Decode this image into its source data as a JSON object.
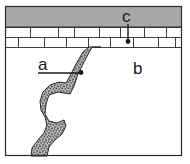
{
  "figure": {
    "type": "geologic-cross-section",
    "frame": {
      "x": 5,
      "y": 6,
      "width": 177,
      "height": 150,
      "border_color": "#2b2b2b",
      "background_color": "#ffffff"
    },
    "layers": [
      {
        "id": "cap-layer",
        "name": "gray-cap-unit",
        "fill_color": "#a8a8a8",
        "top": 6,
        "bottom": 27
      },
      {
        "id": "brick-layer",
        "name": "bedded-brick-unit",
        "fill_color": "#ffffff",
        "top": 27,
        "bottom": 48,
        "rows": 2,
        "row_height": 10
      },
      {
        "id": "host-rock",
        "name": "lower-host-rock",
        "fill_color": "#ffffff",
        "top": 48,
        "bottom": 156
      },
      {
        "id": "dike",
        "name": "igneous-dike",
        "fill_color": "#8e8e8e",
        "pattern": "stipple",
        "top": 47,
        "bottom": 156
      }
    ],
    "labels": [
      {
        "id": "label-a",
        "text": "a",
        "x": 40,
        "y": 70,
        "leader": {
          "type": "horizontal",
          "x1": 38,
          "y1": 73,
          "x2": 82,
          "y2": 73,
          "dot_x": 82,
          "dot_y": 73
        },
        "refers_to": "igneous-dike"
      },
      {
        "id": "label-b",
        "text": "b",
        "x": 134,
        "y": 73,
        "leader": null,
        "refers_to": "lower-host-rock"
      },
      {
        "id": "label-c",
        "text": "c",
        "x": 125,
        "y": 21,
        "leader": {
          "type": "vertical",
          "x1": 128,
          "y1": 23,
          "x2": 128,
          "y2": 41,
          "dot_x": 128,
          "dot_y": 41
        },
        "refers_to": "bedded-brick-unit"
      }
    ],
    "line_color": "#2b2b2b",
    "dot_color": "#1a1a1a"
  }
}
